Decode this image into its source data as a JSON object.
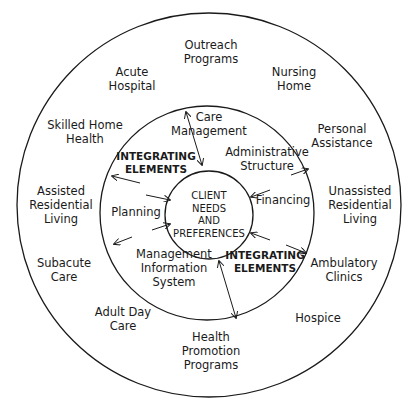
{
  "diagram": {
    "center": {
      "lines": [
        "CLIENT",
        "NEEDS",
        "AND",
        "PREFERENCES"
      ]
    },
    "integrating_ring": {
      "heading_upper": [
        "INTEGRATING",
        "ELEMENTS"
      ],
      "heading_lower": [
        "INTEGRATING",
        "ELEMENTS"
      ],
      "elements": [
        {
          "id": "care-management",
          "lines": [
            "Care",
            "Management"
          ]
        },
        {
          "id": "administrative-structure",
          "lines": [
            "Administrative",
            "Structure"
          ]
        },
        {
          "id": "financing",
          "lines": [
            "Financing"
          ]
        },
        {
          "id": "management-information-system",
          "lines": [
            "Management",
            "Information",
            "System"
          ]
        },
        {
          "id": "planning",
          "lines": [
            "Planning"
          ]
        }
      ]
    },
    "services_ring": {
      "services": [
        {
          "id": "outreach-programs",
          "lines": [
            "Outreach",
            "Programs"
          ]
        },
        {
          "id": "nursing-home",
          "lines": [
            "Nursing",
            "Home"
          ]
        },
        {
          "id": "personal-assistance",
          "lines": [
            "Personal",
            "Assistance"
          ]
        },
        {
          "id": "unassisted-residential-living",
          "lines": [
            "Unassisted",
            "Residential",
            "Living"
          ]
        },
        {
          "id": "ambulatory-clinics",
          "lines": [
            "Ambulatory",
            "Clinics"
          ]
        },
        {
          "id": "hospice",
          "lines": [
            "Hospice"
          ]
        },
        {
          "id": "health-promotion-programs",
          "lines": [
            "Health",
            "Promotion",
            "Programs"
          ]
        },
        {
          "id": "adult-day-care",
          "lines": [
            "Adult Day",
            "Care"
          ]
        },
        {
          "id": "subacute-care",
          "lines": [
            "Subacute",
            "Care"
          ]
        },
        {
          "id": "assisted-residential-living",
          "lines": [
            "Assisted",
            "Residential",
            "Living"
          ]
        },
        {
          "id": "skilled-home-health",
          "lines": [
            "Skilled Home",
            "Health"
          ]
        },
        {
          "id": "acute-hospital",
          "lines": [
            "Acute",
            "Hospital"
          ]
        }
      ]
    },
    "colors": {
      "line": "#1a1a1a",
      "background": "#ffffff"
    }
  }
}
